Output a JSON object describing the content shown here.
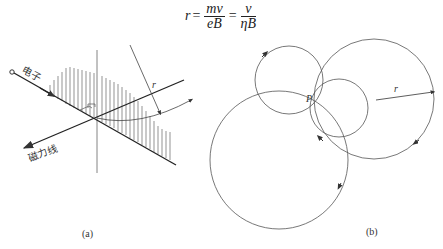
{
  "formula": {
    "lhs": "r",
    "frac1": {
      "num": "mv",
      "den": "eB"
    },
    "frac2": {
      "num": "v",
      "den": "ηB"
    },
    "eq": "="
  },
  "panel_a": {
    "caption": "(a)",
    "electron_label": "电子",
    "field_line_label": "磁力线",
    "radius_label": "r"
  },
  "panel_b": {
    "caption": "(b)",
    "point_label": "P",
    "radius_label": "r"
  },
  "colors": {
    "stroke": "#333333",
    "thin": "#666666"
  }
}
